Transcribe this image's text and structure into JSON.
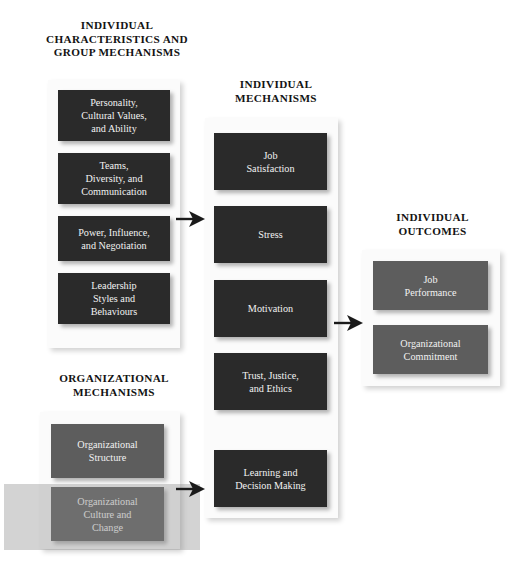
{
  "diagram": {
    "colors": {
      "dark_box": "#2a2a2a",
      "gray_box": "#5d5d5d",
      "panel": "#fbfbfb",
      "text_on_box": "#f2f2f2",
      "heading_text": "#131313",
      "highlight_band": "rgba(140,140,140,0.38)",
      "arrow": "#1a1a1a",
      "background": "#ffffff"
    },
    "sections": [
      {
        "id": "individual-characteristics",
        "heading": "INDIVIDUAL\nCHARACTERISTICS AND\nGROUP MECHANISMS",
        "box_style": "dark",
        "boxes": [
          {
            "id": "personality",
            "label": "Personality,\nCultural Values,\nand Ability"
          },
          {
            "id": "teams",
            "label": "Teams,\nDiversity, and\nCommunication"
          },
          {
            "id": "power",
            "label": "Power, Influence,\nand Negotiation"
          },
          {
            "id": "leadership",
            "label": "Leadership\nStyles and\nBehaviours"
          }
        ]
      },
      {
        "id": "individual-mechanisms",
        "heading": "INDIVIDUAL\nMECHANISMS",
        "box_style": "dark",
        "boxes": [
          {
            "id": "job-satisfaction",
            "label": "Job\nSatisfaction"
          },
          {
            "id": "stress",
            "label": "Stress"
          },
          {
            "id": "motivation",
            "label": "Motivation"
          },
          {
            "id": "trust",
            "label": "Trust, Justice,\nand Ethics"
          },
          {
            "id": "learning",
            "label": "Learning and\nDecision Making"
          }
        ]
      },
      {
        "id": "individual-outcomes",
        "heading": "INDIVIDUAL\nOUTCOMES",
        "box_style": "gray",
        "boxes": [
          {
            "id": "job-performance",
            "label": "Job\nPerformance"
          },
          {
            "id": "org-commitment",
            "label": "Organizational\nCommitment"
          }
        ]
      },
      {
        "id": "organizational-mechanisms",
        "heading": "ORGANIZATIONAL\nMECHANISMS",
        "box_style": "gray",
        "boxes": [
          {
            "id": "org-structure",
            "label": "Organizational\nStructure"
          },
          {
            "id": "org-culture",
            "label": "Organizational\nCulture and\nChange"
          }
        ]
      }
    ],
    "arrows": [
      {
        "id": "left-to-middle",
        "direction": "right",
        "from": "individual-characteristics",
        "to": "individual-mechanisms"
      },
      {
        "id": "bottom-to-middle",
        "direction": "right",
        "from": "organizational-mechanisms",
        "to": "individual-mechanisms"
      },
      {
        "id": "middle-to-right",
        "direction": "right",
        "from": "individual-mechanisms",
        "to": "individual-outcomes"
      }
    ],
    "highlight": {
      "id": "culture-change-highlight",
      "target": "org-culture"
    }
  }
}
